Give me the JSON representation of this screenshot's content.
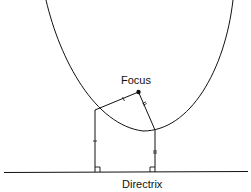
{
  "diagram": {
    "type": "parabola-focus-directrix",
    "labels": {
      "focus": "Focus",
      "directrix": "Directrix"
    },
    "colors": {
      "stroke": "#111111",
      "background": "#ffffff"
    },
    "elements": [
      "parabola curve opening upward",
      "focus point",
      "directrix horizontal line",
      "segment from left parabola point to focus (single tick)",
      "segment from right parabola point to focus (double tick)",
      "perpendicular from left point to directrix (single tick, right-angle mark)",
      "perpendicular from right point to directrix (double tick, right-angle mark)"
    ]
  }
}
